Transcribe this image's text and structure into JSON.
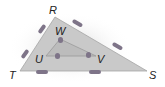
{
  "diagram": {
    "colors": {
      "outer_fill": "#c9c9c9",
      "inner_fill": "#b8b8b8",
      "edge": "#9a9a9a",
      "tick": "#7e7488",
      "label": "#222222"
    },
    "outer_triangle": {
      "name": "RST",
      "vertices": {
        "R": [
          55,
          17
        ],
        "S": [
          147,
          71
        ],
        "T": [
          20,
          71
        ]
      }
    },
    "inner_triangle": {
      "name": "WUV",
      "vertices": {
        "W": [
          60,
          39
        ],
        "U": [
          46,
          56
        ],
        "V": [
          96,
          56
        ]
      }
    },
    "labels": [
      {
        "id": "R",
        "text": "R",
        "x": 49,
        "y": 5
      },
      {
        "id": "W",
        "text": "W",
        "x": 55,
        "y": 26
      },
      {
        "id": "U",
        "text": "U",
        "x": 35,
        "y": 54
      },
      {
        "id": "V",
        "text": "V",
        "x": 97,
        "y": 54
      },
      {
        "id": "T",
        "text": "T",
        "x": 9,
        "y": 70
      },
      {
        "id": "S",
        "text": "S",
        "x": 149,
        "y": 70
      }
    ]
  }
}
